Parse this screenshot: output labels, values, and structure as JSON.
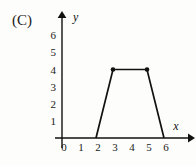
{
  "figure": {
    "choice_label": "(C)",
    "background_color": "#fdfdfb",
    "ink_color": "#111111"
  },
  "chart_data": {
    "type": "line",
    "title": "",
    "subtitle": "",
    "xlabel": "x",
    "ylabel": "y",
    "xlim": [
      0,
      6.5
    ],
    "ylim": [
      0,
      6.5
    ],
    "grid": false,
    "legend": null,
    "x_ticks": [
      0,
      1,
      2,
      3,
      4,
      5,
      6
    ],
    "x_tick_labels": [
      "0",
      "1",
      "2",
      "3",
      "4",
      "5",
      "6"
    ],
    "y_ticks": [
      1,
      2,
      3,
      4,
      5,
      6
    ],
    "y_tick_labels": [
      "1",
      "2",
      "3",
      "4",
      "5",
      "6"
    ],
    "series": [
      {
        "name": "trapezoid",
        "x": [
          2,
          3,
          5,
          6
        ],
        "y": [
          0,
          4,
          4,
          0
        ],
        "marked_points": [
          {
            "x": 3,
            "y": 4
          },
          {
            "x": 5,
            "y": 4
          }
        ]
      }
    ],
    "annotations": [
      "(C)"
    ]
  }
}
